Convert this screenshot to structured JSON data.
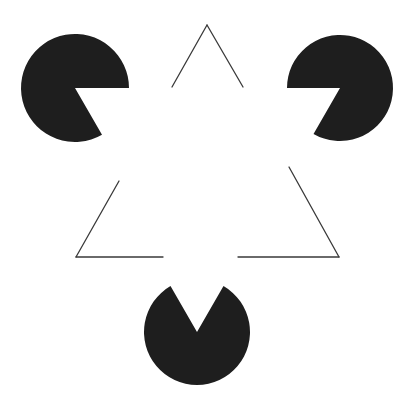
{
  "figure": {
    "background": "#ffffff",
    "pacman_color": "#1e1e1e",
    "line_color": "#3a3a3a",
    "pacmen": [
      {
        "name": "top-left",
        "cx": 75,
        "cy": 88,
        "r": 54,
        "mouth_start_deg": 0,
        "mouth_end_deg": 60
      },
      {
        "name": "top-right",
        "cx": 340,
        "cy": 88,
        "r": 53,
        "mouth_start_deg": 120,
        "mouth_end_deg": 180
      },
      {
        "name": "bottom",
        "cx": 197,
        "cy": 332,
        "r": 53,
        "mouth_start_deg": 240,
        "mouth_end_deg": 300
      }
    ],
    "outline_triangle_segments": [
      {
        "name": "apex-left",
        "x1": 207,
        "y1": 25,
        "x2": 172,
        "y2": 87
      },
      {
        "name": "apex-right",
        "x1": 207,
        "y1": 25,
        "x2": 243,
        "y2": 87
      },
      {
        "name": "bottom-left-up",
        "x1": 76,
        "y1": 257,
        "x2": 119,
        "y2": 181
      },
      {
        "name": "bottom-left-across",
        "x1": 76,
        "y1": 257,
        "x2": 163,
        "y2": 257
      },
      {
        "name": "bottom-right-up",
        "x1": 339,
        "y1": 257,
        "x2": 289,
        "y2": 167
      },
      {
        "name": "bottom-right-across",
        "x1": 339,
        "y1": 257,
        "x2": 238,
        "y2": 257
      }
    ]
  }
}
